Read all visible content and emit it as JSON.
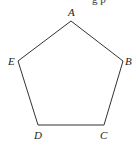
{
  "diagram": {
    "top_fragment": "g p",
    "vertices": [
      {
        "label": "A",
        "x": 71,
        "y": 21,
        "lx": 68,
        "ly": 16
      },
      {
        "label": "B",
        "x": 123,
        "y": 61,
        "lx": 125,
        "ly": 65
      },
      {
        "label": "C",
        "x": 104,
        "y": 125,
        "lx": 100,
        "ly": 139
      },
      {
        "label": "D",
        "x": 38,
        "y": 125,
        "lx": 34,
        "ly": 139
      },
      {
        "label": "E",
        "x": 18,
        "y": 61,
        "lx": 8,
        "ly": 65
      }
    ],
    "stroke_color": "#333333"
  }
}
